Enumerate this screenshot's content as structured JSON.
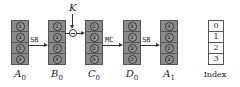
{
  "diagram": {
    "key_label": "K",
    "operations": {
      "sb1": "SB",
      "mc": "MC",
      "sb2": "SB"
    },
    "columns": [
      {
        "name": "A0",
        "base": "A",
        "sub": "0",
        "cells": [
          "①",
          "③",
          "②",
          "④"
        ]
      },
      {
        "name": "B0",
        "base": "B",
        "sub": "0",
        "cells": [
          "①",
          "③",
          "②",
          "④"
        ]
      },
      {
        "name": "C0",
        "base": "C",
        "sub": "0",
        "cells": [
          "①",
          "③",
          "②",
          "④"
        ]
      },
      {
        "name": "D0",
        "base": "D",
        "sub": "0",
        "cells": [
          "④",
          "①",
          "③",
          "②"
        ]
      },
      {
        "name": "A1",
        "base": "A",
        "sub": "1",
        "cells": [
          "④",
          "①",
          "②",
          "③"
        ]
      }
    ],
    "index": {
      "label": "Index",
      "values": [
        "0",
        "1",
        "2",
        "3"
      ]
    }
  }
}
